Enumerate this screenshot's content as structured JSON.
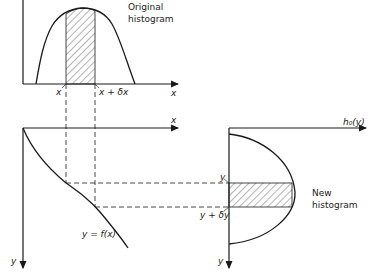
{
  "top_panel": {
    "title_line1": "Original",
    "title_line2": "histogram",
    "x_tick_1": "x",
    "x_tick_2": "x + δx",
    "axis_label": "x"
  },
  "mapping_panel": {
    "x_axis_label": "x",
    "y_axis_label": "y",
    "curve_label": "y = f(x)"
  },
  "right_panel": {
    "h_axis_label": "h₀(y)",
    "y_axis_label": "y",
    "y_tick_1": "y",
    "y_tick_2": "y + δy",
    "title_line1": "New",
    "title_line2": "histogram"
  },
  "colors": {
    "line": "#1a1a1a",
    "hatch": "#444444"
  }
}
